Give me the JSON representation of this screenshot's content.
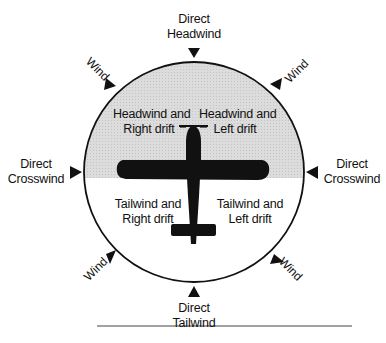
{
  "diagram": {
    "title_labels": {
      "top": {
        "line1": "Direct",
        "line2": "Headwind"
      },
      "bottom": {
        "line1": "Direct",
        "line2": "Tailwind"
      },
      "left": {
        "line1": "Direct",
        "line2": "Crosswind"
      },
      "right": {
        "line1": "Direct",
        "line2": "Crosswind"
      }
    },
    "wind_labels": {
      "top_left": "Wind",
      "top_right": "Wind",
      "bottom_left": "Wind",
      "bottom_right": "Wind"
    },
    "quadrants": {
      "upper_left": {
        "line1": "Headwind and",
        "line2": "Right drift"
      },
      "upper_right": {
        "line1": "Headwind and",
        "line2": "Left drift"
      },
      "lower_left": {
        "line1": "Tailwind and",
        "line2": "Right drift"
      },
      "lower_right": {
        "line1": "Tailwind and",
        "line2": "Left drift"
      }
    },
    "colors": {
      "ink": "#111111",
      "shade": "#d9d9d9",
      "background": "#ffffff"
    }
  }
}
